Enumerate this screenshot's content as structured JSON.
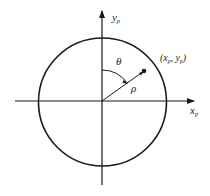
{
  "diagram": {
    "labels": {
      "y_axis": "y",
      "y_axis_sub": "p",
      "x_axis": "x",
      "x_axis_sub": "p",
      "angle": "θ",
      "radius": "ρ",
      "point": "(x",
      "point_sub1": "p",
      "point_mid": ", y",
      "point_sub2": "p",
      "point_end": ")"
    },
    "colors": {
      "stroke": "#1a1a1a",
      "background": "#ffffff"
    }
  }
}
